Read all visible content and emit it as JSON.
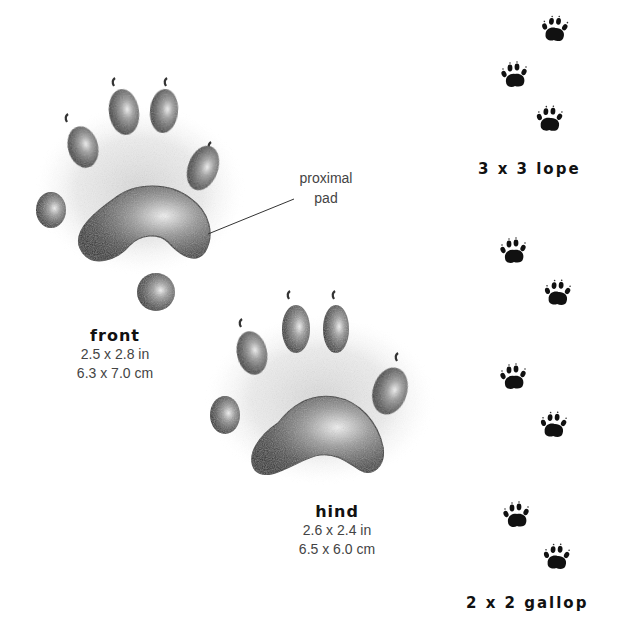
{
  "prints": {
    "front": {
      "title": "front",
      "size_in": "2.5 x 2.8 in",
      "size_cm": "6.3 x 7.0 cm"
    },
    "hind": {
      "title": "hind",
      "size_in": "2.6 x 2.4 in",
      "size_cm": "6.5 x 6.0 cm"
    }
  },
  "callout": {
    "line1": "proximal",
    "line2": "pad"
  },
  "gaits": [
    {
      "label": "3 x 3 lope",
      "track_count": 3
    },
    {
      "label": "2 x 2 gallop",
      "track_count": 6
    }
  ],
  "colors": {
    "ink": "#111111",
    "shading": "#555555",
    "background": "#ffffff"
  }
}
